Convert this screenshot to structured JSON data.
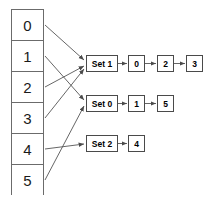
{
  "diagram": {
    "type": "hash-table-with-chaining",
    "background_color": "#ffffff",
    "line_color": "#555555",
    "box_border_color": "#4a4a4a",
    "array": {
      "label": "index-array",
      "cells": [
        {
          "label": "0"
        },
        {
          "label": "1"
        },
        {
          "label": "2"
        },
        {
          "label": "3"
        },
        {
          "label": "4"
        },
        {
          "label": "5"
        }
      ]
    },
    "buckets": [
      {
        "label": "Set 1",
        "x": 86,
        "y": 55,
        "nodes": [
          {
            "label": "0",
            "x": 128,
            "y": 55
          },
          {
            "label": "2",
            "x": 157,
            "y": 55
          },
          {
            "label": "3",
            "x": 186,
            "y": 55
          }
        ]
      },
      {
        "label": "Set 0",
        "x": 86,
        "y": 95,
        "nodes": [
          {
            "label": "1",
            "x": 128,
            "y": 95
          },
          {
            "label": "5",
            "x": 157,
            "y": 95
          }
        ]
      },
      {
        "label": "Set 2",
        "x": 86,
        "y": 135,
        "nodes": [
          {
            "label": "4",
            "x": 128,
            "y": 135
          }
        ]
      }
    ],
    "mappings": [
      {
        "from_cell": "0",
        "to_bucket": "Set 1",
        "x1": 45,
        "y1": 25,
        "x2": 84,
        "y2": 60
      },
      {
        "from_cell": "1",
        "to_bucket": "Set 0",
        "x1": 45,
        "y1": 56,
        "x2": 84,
        "y2": 100
      },
      {
        "from_cell": "2",
        "to_bucket": "Set 1",
        "x1": 45,
        "y1": 87,
        "x2": 84,
        "y2": 66
      },
      {
        "from_cell": "3",
        "to_bucket": "Set 1",
        "x1": 45,
        "y1": 118,
        "x2": 84,
        "y2": 69
      },
      {
        "from_cell": "4",
        "to_bucket": "Set 2",
        "x1": 45,
        "y1": 149,
        "x2": 84,
        "y2": 144
      },
      {
        "from_cell": "5",
        "to_bucket": "Set 0",
        "x1": 45,
        "y1": 180,
        "x2": 84,
        "y2": 106
      }
    ]
  }
}
